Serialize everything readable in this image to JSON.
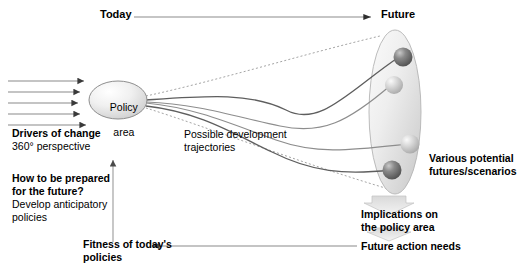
{
  "diagram": {
    "title_axis": {
      "today": "Today",
      "future": "Future"
    },
    "policy_node": {
      "line1": "Policy",
      "line2": "area"
    },
    "drivers": {
      "heading": "Drivers of change",
      "subtext": "360° perspective"
    },
    "trajectories": {
      "line1": "Possible development",
      "line2": "trajectories"
    },
    "question": {
      "heading_line1": "How to be prepared",
      "heading_line2": "for the future?",
      "subtext_line1": "Develop anticipatory",
      "subtext_line2": "policies"
    },
    "futures": {
      "line1": "Various potential",
      "line2": "futures/scenarios"
    },
    "implications": {
      "line1": "Implications on",
      "line2": "the policy area"
    },
    "future_action_needs": "Future action needs",
    "fitness": {
      "line1": "Fitness of today's",
      "line2": "policies"
    },
    "colors": {
      "text": "#000000",
      "line_gray": "#808080",
      "line_dark": "#4d4d4d",
      "cone_dotted": "#8f8f8f",
      "ellipse_fill_light": "#f2f2f2",
      "ellipse_fill_mid": "#d4d4d4",
      "sphere_dark": "#6e6e6e",
      "sphere_light": "#c8c8c8",
      "arrow_block": "#cccccc",
      "background": "#ffffff"
    },
    "counts": {
      "driver_arrows": 5,
      "trajectory_curves": 4,
      "future_spheres": 4,
      "block_arrows": 2
    }
  }
}
